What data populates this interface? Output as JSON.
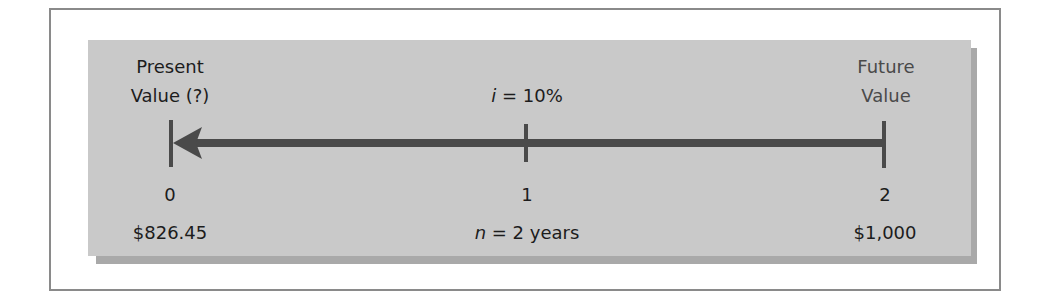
{
  "diagram": {
    "left_label": {
      "line1": "Present",
      "line2": "Value (?)"
    },
    "middle_label": {
      "variable": "i",
      "text": " = 10%"
    },
    "right_label": {
      "line1": "Future",
      "line2": "Value"
    },
    "periods": [
      "0",
      "1",
      "2"
    ],
    "bottom_values": {
      "left": "$826.45",
      "middle_variable": "n",
      "middle_text": " = 2 years",
      "right": "$1,000"
    },
    "arrow_direction": "right-to-left",
    "colors": {
      "panel": "#c9c9c9",
      "panel_shadow": "#a9a9a9",
      "line": "#4a4a4a",
      "frame_border": "#8a8a8a",
      "text": "#1c1c1c"
    }
  }
}
